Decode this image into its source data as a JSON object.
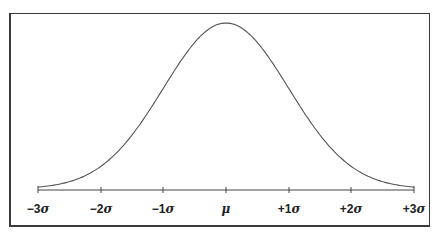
{
  "diagram": {
    "title": "",
    "type": "normal-distribution-bell-curve",
    "axis_labels": [
      {
        "prefix": "−3",
        "symbol": "σ"
      },
      {
        "prefix": "−2",
        "symbol": "σ"
      },
      {
        "prefix": "−1",
        "symbol": "σ"
      },
      {
        "prefix": "",
        "symbol": "μ"
      },
      {
        "prefix": "+1",
        "symbol": "σ"
      },
      {
        "prefix": "+2",
        "symbol": "σ"
      },
      {
        "prefix": "+3",
        "symbol": "σ"
      }
    ],
    "colors": {
      "frame": "#3a3a3a",
      "curve": "#555555",
      "axis": "#444444",
      "text": "#222222"
    }
  }
}
